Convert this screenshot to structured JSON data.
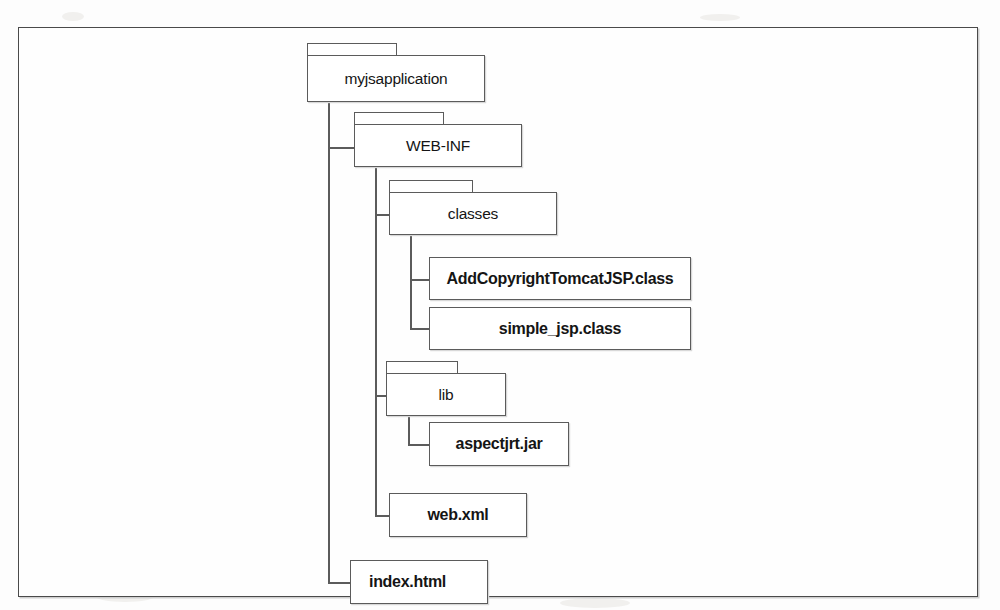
{
  "diagram": {
    "type": "directory-tree",
    "title": "",
    "nodes": [
      {
        "id": "myjsapplication",
        "label": "myjsapplication",
        "kind": "folder",
        "depth": 0,
        "parent": null
      },
      {
        "id": "web-inf",
        "label": "WEB-INF",
        "kind": "folder",
        "depth": 1,
        "parent": "myjsapplication"
      },
      {
        "id": "classes",
        "label": "classes",
        "kind": "folder",
        "depth": 2,
        "parent": "web-inf"
      },
      {
        "id": "addcopyrighttomcatjsp-class",
        "label": "AddCopyrightTomcatJSP.class",
        "kind": "file",
        "depth": 3,
        "parent": "classes"
      },
      {
        "id": "simple-jsp-class",
        "label": "simple_jsp.class",
        "kind": "file",
        "depth": 3,
        "parent": "classes"
      },
      {
        "id": "lib",
        "label": "lib",
        "kind": "folder",
        "depth": 2,
        "parent": "web-inf"
      },
      {
        "id": "aspectjrt-jar",
        "label": "aspectjrt.jar",
        "kind": "file",
        "depth": 3,
        "parent": "lib"
      },
      {
        "id": "web-xml",
        "label": "web.xml",
        "kind": "file",
        "depth": 2,
        "parent": "web-inf"
      },
      {
        "id": "index-html",
        "label": "index.html",
        "kind": "file",
        "depth": 1,
        "parent": "myjsapplication"
      }
    ],
    "colors": {
      "stroke": "#5b5b5b",
      "frame_stroke": "#4a4a4a",
      "node_fill": "#ffffff",
      "text": "#151515",
      "page_background": "#fdfdfd"
    }
  }
}
